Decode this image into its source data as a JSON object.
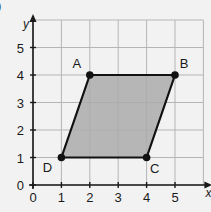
{
  "corner_mark": ")",
  "chart_data": {
    "type": "diagram",
    "xlabel": "x",
    "ylabel": "y",
    "xlim": [
      0,
      6
    ],
    "ylim": [
      0,
      6
    ],
    "grid": true,
    "x_ticks": [
      0,
      1,
      2,
      3,
      4,
      5
    ],
    "y_ticks": [
      0,
      1,
      2,
      3,
      4,
      5
    ],
    "shape": {
      "name": "parallelogram",
      "fill": "#ababab",
      "stroke": "#111111",
      "vertices": [
        {
          "label": "A",
          "x": 2,
          "y": 4,
          "label_pos": "top-left"
        },
        {
          "label": "B",
          "x": 5,
          "y": 4,
          "label_pos": "top-right"
        },
        {
          "label": "C",
          "x": 4,
          "y": 1,
          "label_pos": "bottom-right"
        },
        {
          "label": "D",
          "x": 1,
          "y": 1,
          "label_pos": "bottom-left"
        }
      ]
    },
    "colors": {
      "grid": "#b5b5b5",
      "axis": "#1a1a1a",
      "background": "#f2f2f2"
    }
  }
}
